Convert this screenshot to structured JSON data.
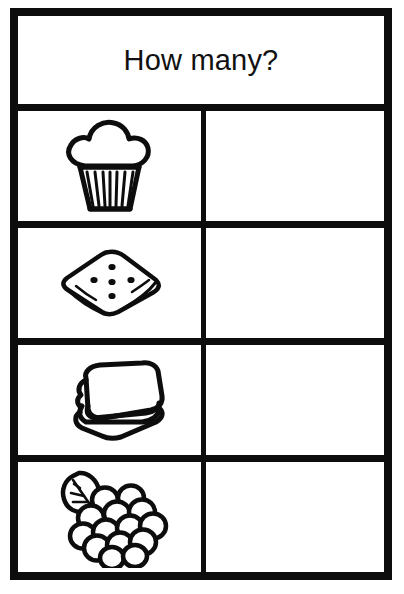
{
  "worksheet": {
    "header": {
      "title": "How many?"
    },
    "columns": [
      {
        "name": "picture-column",
        "label": ""
      },
      {
        "name": "answer-column",
        "label": ""
      }
    ],
    "rows": [
      {
        "icon": "muffin-icon",
        "icon_label": "muffin",
        "answer": ""
      },
      {
        "icon": "cracker-icon",
        "icon_label": "cracker",
        "answer": ""
      },
      {
        "icon": "sandwich-icon",
        "icon_label": "sandwich",
        "answer": ""
      },
      {
        "icon": "grapes-icon",
        "icon_label": "grapes",
        "answer": ""
      }
    ]
  },
  "colors": {
    "ink": "#0d0d0d",
    "paper": "#ffffff",
    "text": "#111111"
  }
}
